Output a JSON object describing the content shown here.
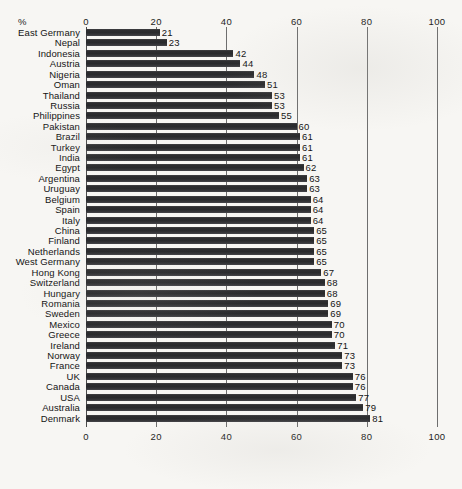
{
  "chart_data": {
    "type": "bar",
    "orientation": "horizontal",
    "title": "",
    "xlabel": "%",
    "ylabel": "",
    "xlim": [
      0,
      100
    ],
    "xticks": [
      0,
      20,
      40,
      60,
      80,
      100
    ],
    "xtick_labels": [
      "0",
      "20",
      "40",
      "60",
      "80",
      "100"
    ],
    "grid": true,
    "grid_axis": "x",
    "legend": false,
    "axis_label_top": "%",
    "bar_color": "#2f2f30",
    "background_color": "#f7f6f3",
    "text_color": "#141414",
    "gridline_color": "#6e6e6e",
    "value_labels": true,
    "categories": [
      "East Germany",
      "Nepal",
      "Indonesia",
      "Austria",
      "Nigeria",
      "Oman",
      "Thailand",
      "Russia",
      "Philippines",
      "Pakistan",
      "Brazil",
      "Turkey",
      "India",
      "Egypt",
      "Argentina",
      "Uruguay",
      "Belgium",
      "Spain",
      "Italy",
      "China",
      "Finland",
      "Netherlands",
      "West Germany",
      "Hong Kong",
      "Switzerland",
      "Hungary",
      "Romania",
      "Sweden",
      "Mexico",
      "Greece",
      "Ireland",
      "Norway",
      "France",
      "UK",
      "Canada",
      "USA",
      "Australia",
      "Denmark"
    ],
    "values": [
      21,
      23,
      42,
      44,
      48,
      51,
      53,
      53,
      55,
      60,
      61,
      61,
      61,
      62,
      63,
      63,
      64,
      64,
      64,
      65,
      65,
      65,
      65,
      67,
      68,
      68,
      69,
      69,
      70,
      70,
      71,
      73,
      73,
      76,
      76,
      77,
      79,
      81
    ]
  }
}
